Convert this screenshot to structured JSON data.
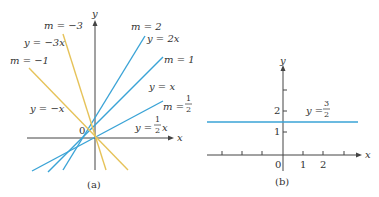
{
  "colors": {
    "blue": "#3aa3d6",
    "yellow": "#e6c35a",
    "axis": "#444444"
  },
  "panel_a": {
    "caption": "(a)",
    "origin_label": "0",
    "x_axis_label": "x",
    "y_axis_label": "y",
    "lines": [
      {
        "slope": 2,
        "color": "blue",
        "m_label": "m = 2",
        "eq_label": "y = 2x"
      },
      {
        "slope": 1,
        "color": "blue",
        "m_label": "m = 1",
        "eq_label": "y = x"
      },
      {
        "slope": 0.5,
        "color": "blue",
        "m_label": "m = 1/2",
        "eq_label": "y = 1/2 x"
      },
      {
        "slope": -3,
        "color": "yellow",
        "m_label": "m = −3",
        "eq_label": "y = −3x"
      },
      {
        "slope": -1,
        "color": "yellow",
        "m_label": "m = −1",
        "eq_label": "y = −x"
      }
    ],
    "labels": {
      "m2": "m = 2",
      "y2x": "y = 2x",
      "m1": "m = 1",
      "yx": "y = x",
      "mhalf_prefix": "m = ",
      "yhalf_prefix": "y = ",
      "yhalf_suffix": "x",
      "frac_num": "1",
      "frac_den": "2",
      "mneg3": "m = −3",
      "yneg3x": "y = −3x",
      "mneg1": "m = −1",
      "ynegx": "y = −x"
    }
  },
  "panel_b": {
    "caption": "(b)",
    "origin_label": "0",
    "x_axis_label": "x",
    "y_axis_label": "y",
    "x_tick_labels": [
      "1",
      "2"
    ],
    "y_tick_labels": [
      "1",
      "2"
    ],
    "line": {
      "y": 1.5,
      "color": "blue"
    },
    "eq_prefix": "y = ",
    "frac_num": "3",
    "frac_den": "2"
  }
}
